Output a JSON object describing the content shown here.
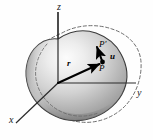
{
  "figure": {
    "background_color": "#fefefe",
    "width": 153,
    "height": 140,
    "axes": {
      "origin": {
        "x": 58,
        "y": 83
      },
      "labels": {
        "z": "z",
        "y": "y",
        "x": "x"
      },
      "color": "#2b2b2b",
      "z_axis": {
        "x1": 58,
        "y1": 83,
        "x2": 58,
        "y2": 12
      },
      "y_axis": {
        "x1": 58,
        "y1": 83,
        "x2": 136,
        "y2": 83
      },
      "x_axis": {
        "x1": 58,
        "y1": 83,
        "x2": 16,
        "y2": 123
      }
    },
    "points": {
      "P": {
        "label": "P",
        "x": 103,
        "y": 61,
        "description": "undeformed material point"
      },
      "P_prime": {
        "label": "P′",
        "x": 95,
        "y": 47,
        "description": "displaced material point"
      }
    },
    "vectors": [
      {
        "name": "position-vector",
        "label": "r",
        "from": {
          "x": 58,
          "y": 83
        },
        "to": {
          "x": 101,
          "y": 63
        },
        "color": "#000000",
        "style": "solid-bold-arrow"
      },
      {
        "name": "displacement-vector",
        "label": "u",
        "from": {
          "x": 101,
          "y": 63
        },
        "to": {
          "x": 96,
          "y": 45
        },
        "color": "#000000",
        "style": "solid-bold-arrow"
      }
    ],
    "body": {
      "undeformed": {
        "name": "solid-blob",
        "style": "filled-shaded",
        "outline_color": "#3a3a3a",
        "fill_light": "#f2f2f2",
        "fill_mid": "#c9c9c9",
        "fill_dark": "#8e8e8e"
      },
      "deformed": {
        "name": "dashed-outline",
        "style": "dashed",
        "outline_color": "#5a5a5a"
      }
    }
  }
}
